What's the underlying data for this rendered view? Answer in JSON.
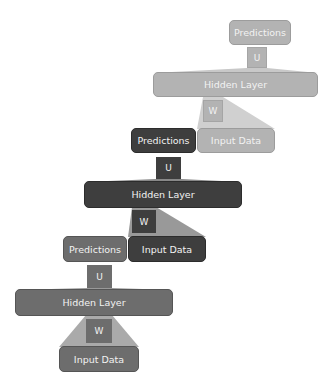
{
  "diagram": {
    "colors": {
      "light": "#b3b3b3",
      "dark": "#3e3e3e",
      "medium": "#6d6d6d"
    },
    "stages": [
      {
        "shade": "light",
        "predictions": "Predictions",
        "u_label": "U",
        "hidden": "Hidden Layer",
        "w_label": "W",
        "input": "Input Data"
      },
      {
        "shade": "dark",
        "predictions": "Predictions",
        "u_label": "U",
        "hidden": "Hidden Layer",
        "w_label": "W",
        "input": "Input Data"
      },
      {
        "shade": "medium",
        "predictions": "Predictions",
        "u_label": "U",
        "hidden": "Hidden Layer",
        "w_label": "W",
        "input": "Input Data"
      }
    ]
  }
}
